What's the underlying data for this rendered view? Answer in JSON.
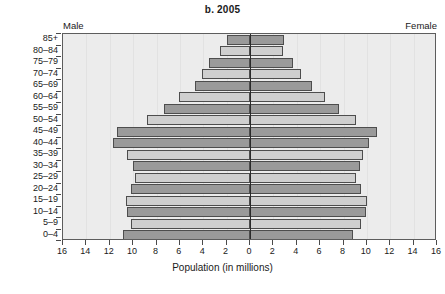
{
  "chart_data": {
    "type": "bar",
    "subtype": "population-pyramid",
    "title": "b. 2005",
    "xlabel": "Population (in millions)",
    "ylabel": "",
    "left_caption": "Male",
    "right_caption": "Female",
    "categories": [
      "85+",
      "80–84",
      "75–79",
      "70–74",
      "65–69",
      "60–64",
      "55–59",
      "50–54",
      "45–49",
      "40–44",
      "35–39",
      "30–34",
      "25–29",
      "20–24",
      "15–19",
      "10–14",
      "5–9",
      "0–4"
    ],
    "series": [
      {
        "name": "Male",
        "side": "left",
        "values": [
          2.0,
          2.6,
          3.5,
          4.1,
          4.7,
          6.1,
          7.4,
          8.8,
          11.4,
          11.7,
          10.5,
          10.0,
          9.8,
          10.2,
          10.6,
          10.5,
          10.2,
          10.9
        ]
      },
      {
        "name": "Female",
        "side": "right",
        "values": [
          2.9,
          2.8,
          3.7,
          4.4,
          5.3,
          6.4,
          7.6,
          9.1,
          10.9,
          10.2,
          9.7,
          9.4,
          9.1,
          9.5,
          10.0,
          9.9,
          9.5,
          8.8
        ]
      }
    ],
    "bar_shades": [
      "dark",
      "light",
      "dark",
      "light",
      "dark",
      "light",
      "dark",
      "light",
      "dark",
      "dark",
      "light",
      "dark",
      "light",
      "dark",
      "light",
      "dark",
      "light",
      "dark"
    ],
    "x_ticks": [
      16,
      14,
      12,
      10,
      8,
      6,
      4,
      2,
      0,
      2,
      4,
      6,
      8,
      10,
      12,
      14,
      16
    ],
    "xlim": [
      -16,
      16
    ],
    "grid": true,
    "legend": "none",
    "colors": {
      "bar_dark": "#9a9a9a",
      "bar_light": "#cfcfcf",
      "plot_background": "#ececec",
      "axis": "#2a2a2a",
      "frame": "#5d5d5d"
    }
  }
}
